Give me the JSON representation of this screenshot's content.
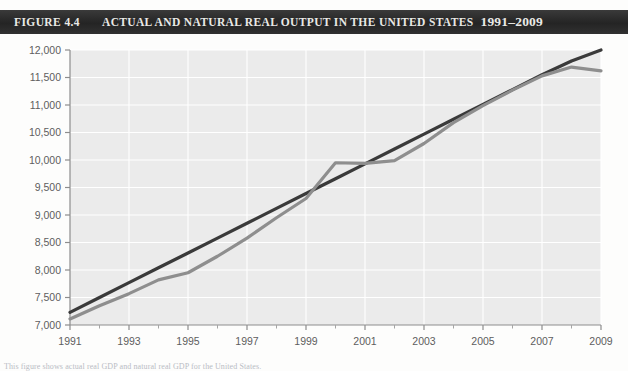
{
  "header": {
    "figure_number": "Figure 4.4",
    "title": "Actual and Natural Real Output in the United States",
    "year_range": "1991–2009",
    "bar_color": "#2b2b2b",
    "text_color": "#e9e9e6"
  },
  "caption": {
    "text": "This figure shows actual real GDP and natural real GDP for the United States."
  },
  "chart_data": {
    "type": "line",
    "title": "Actual and Natural Real Output in the United States 1991–2009",
    "xlabel": "",
    "ylabel": "",
    "xlim": [
      1991,
      2009
    ],
    "ylim": [
      7000,
      12000
    ],
    "ytick_step": 500,
    "grid": true,
    "grid_color": "#ffffff",
    "plot_background": "#ebebeb",
    "legend_position": "none",
    "x": [
      1991,
      1992,
      1993,
      1994,
      1995,
      1996,
      1997,
      1998,
      1999,
      2000,
      2001,
      2002,
      2003,
      2004,
      2005,
      2006,
      2007,
      2008,
      2009
    ],
    "ytick_labels": [
      "7,000",
      "7,500",
      "8,000",
      "8,500",
      "9,000",
      "9,500",
      "10,000",
      "10,500",
      "11,000",
      "11,500",
      "12,000"
    ],
    "ytick_values": [
      7000,
      7500,
      8000,
      8500,
      9000,
      9500,
      10000,
      10500,
      11000,
      11500,
      12000
    ],
    "xtick_labels": [
      "1991",
      "1993",
      "1995",
      "1997",
      "1999",
      "2001",
      "2003",
      "2005",
      "2007",
      "2009"
    ],
    "xtick_values": [
      1991,
      1993,
      1995,
      1997,
      1999,
      2001,
      2003,
      2005,
      2007,
      2009
    ],
    "xminor_values": [
      1992,
      1994,
      1996,
      1998,
      2000,
      2002,
      2004,
      2006,
      2008
    ],
    "series": [
      {
        "name": "Natural real output",
        "color": "#3a3a3a",
        "width": 3.2,
        "values": [
          7230,
          7500,
          7770,
          8040,
          8310,
          8580,
          8850,
          9120,
          9390,
          9660,
          9930,
          10200,
          10470,
          10740,
          11010,
          11280,
          11550,
          11800,
          12000
        ]
      },
      {
        "name": "Actual real output",
        "color": "#8e8e8e",
        "width": 3.2,
        "values": [
          7110,
          7350,
          7570,
          7820,
          7950,
          8250,
          8580,
          8950,
          9300,
          9950,
          9940,
          9990,
          10300,
          10680,
          10990,
          11270,
          11530,
          11690,
          11620
        ]
      }
    ]
  }
}
